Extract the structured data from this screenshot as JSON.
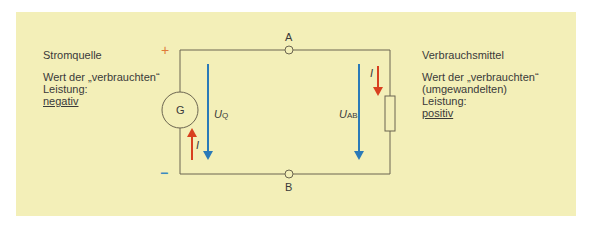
{
  "left_block": {
    "title": "Stromquelle",
    "line1": "Wert der „verbrauchten“",
    "line2": "Leistung:",
    "value": "negativ"
  },
  "right_block": {
    "title": "Verbrauchsmittel",
    "line1": "Wert der „verbrauchten“",
    "line2": "(umgewandelten)",
    "line3": "Leistung:",
    "value": "positiv"
  },
  "diagram": {
    "plus": "+",
    "minus": "−",
    "terminal_a": "A",
    "terminal_b": "B",
    "generator": "G",
    "current": "I",
    "uq_main": "U",
    "uq_sub": "Q",
    "uab_main": "U",
    "uab_sub": "AB",
    "colors": {
      "panel": "#f3efb8",
      "wire": "#6b6550",
      "red": "#d8401f",
      "blue": "#2a7ab8",
      "plus": "#e07a3a",
      "minus": "#3a8ac0"
    }
  }
}
